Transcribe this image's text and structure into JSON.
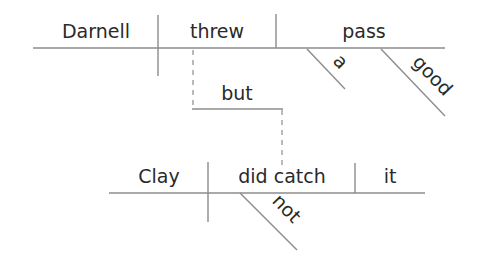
{
  "diagram": {
    "type": "sentence-diagram",
    "sentence": "Darnell threw a good pass, but Clay did not catch it.",
    "clause1": {
      "subject": "Darnell",
      "verb": "threw",
      "object": "pass",
      "modifiers": [
        "a",
        "good"
      ]
    },
    "conjunction": "but",
    "clause2": {
      "subject": "Clay",
      "verb": "did catch",
      "object": "it",
      "modifiers": [
        "not"
      ]
    },
    "colors": {
      "line": "#8c8c8c",
      "text": "#2a2a2a",
      "background": "#ffffff"
    }
  }
}
